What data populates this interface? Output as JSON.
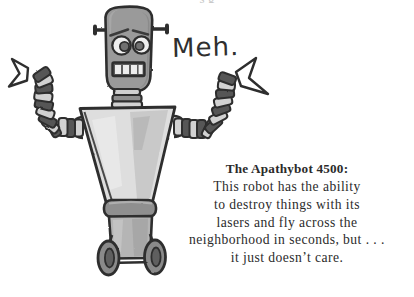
{
  "page": {
    "background_color": "#ffffff",
    "width": 414,
    "height": 297,
    "kind": "hand-drawn cartoon illustration with caption"
  },
  "top_remnant": {
    "text": "s g",
    "note": "faint descenders of a cropped line of text above the illustration"
  },
  "speech": {
    "text": "Meh."
  },
  "caption": {
    "title": "The Apathybot 4500:",
    "lines": [
      "This robot has the ability",
      "to destroy things with its",
      "lasers and fly across the",
      "neighborhood in seconds, but . . .",
      "it just doesn’t care."
    ],
    "full_text": "The Apathybot 4500: This robot has the ability to destroy things with its lasers and fly across the neighborhood in seconds, but . . . it just doesn’t care."
  },
  "illustration": {
    "subject": "robot",
    "name": "Apathybot 4500",
    "colors": {
      "outline": "#2e2e2e",
      "head_fill": "#9a9a9a",
      "head_shadow": "#848484",
      "torso_fill": "#dedede",
      "torso_shadow": "#b9b9b9",
      "limb_dark": "#575757",
      "limb_light": "#d2d2d2",
      "belt_fill": "#8f8f8f",
      "base_fill": "#b5b5b5",
      "wheel_fill": "#8a8a8a",
      "eye_white": "#f2f2f2",
      "paper": "#ffffff"
    },
    "parts": [
      "antenna-left",
      "antenna-right",
      "head",
      "eyebrow-left",
      "eyebrow-right",
      "eye-left",
      "eye-right",
      "mouth-grid",
      "neck",
      "torso",
      "arm-left",
      "arm-right",
      "claw-left",
      "claw-right",
      "belt",
      "base",
      "wheel-left",
      "wheel-right"
    ]
  }
}
